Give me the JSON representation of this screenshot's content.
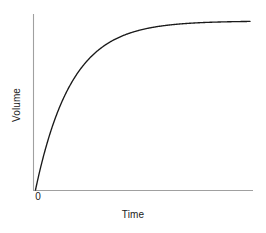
{
  "figure": {
    "background_color": "#ffffff",
    "width": 266,
    "height": 233
  },
  "axes": {
    "x_title": "Time",
    "y_title": "Volume",
    "origin_label": "0",
    "axis_color": "#a0a0a0",
    "curve_color": "#1a1a1a"
  },
  "chart_data": {
    "type": "line",
    "title": "",
    "subtitle": "",
    "xlabel": "Time",
    "ylabel": "Volume",
    "xlim": [
      0,
      1
    ],
    "ylim": [
      0,
      1.1
    ],
    "xticks": [
      0
    ],
    "xticklabels": [
      "0"
    ],
    "yticks": [],
    "yticklabels": [],
    "grid": false,
    "legend": false,
    "legend_position": "none",
    "annotations": [],
    "series": [
      {
        "name": "Volume",
        "color": "#1a1a1a",
        "model": "Vmax*(1-exp(-k*t))",
        "params": {
          "Vmax": 1.0,
          "k": 6.0
        },
        "x": [
          0.0,
          0.02,
          0.04,
          0.06,
          0.08,
          0.1,
          0.12,
          0.14,
          0.16,
          0.18,
          0.2,
          0.24,
          0.28,
          0.32,
          0.36,
          0.4,
          0.45,
          0.5,
          0.55,
          0.6,
          0.65,
          0.7,
          0.75,
          0.8,
          0.85,
          0.9,
          0.95,
          1.0
        ],
        "y": [
          0.0,
          0.113,
          0.213,
          0.302,
          0.381,
          0.451,
          0.513,
          0.568,
          0.617,
          0.661,
          0.699,
          0.763,
          0.814,
          0.853,
          0.885,
          0.909,
          0.933,
          0.95,
          0.963,
          0.973,
          0.98,
          0.985,
          0.989,
          0.992,
          0.994,
          0.995,
          0.997,
          0.998
        ]
      }
    ]
  }
}
